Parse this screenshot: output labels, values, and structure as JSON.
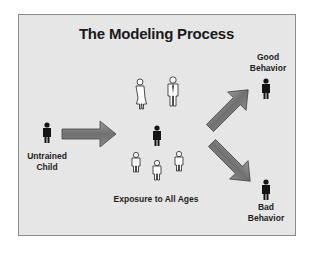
{
  "diagram": {
    "title": "The Modeling Process",
    "nodes": {
      "untrained_child": {
        "line1": "Untrained",
        "line2": "Child",
        "icon": "person-dark-icon"
      },
      "exposure": {
        "label": "Exposure to All Ages",
        "icons": [
          "person-woman-outline-icon",
          "person-man-tie-outline-icon",
          "person-dark-icon",
          "person-child-outline-icon",
          "person-child-outline-icon",
          "person-child-outline-icon"
        ]
      },
      "good_behavior": {
        "line1": "Good",
        "line2": "Behavior",
        "icon": "person-dark-icon"
      },
      "bad_behavior": {
        "line1": "Bad",
        "line2": "Behavior",
        "icon": "person-dark-icon"
      }
    },
    "edges": [
      {
        "from": "untrained_child",
        "to": "exposure"
      },
      {
        "from": "exposure",
        "to": "good_behavior"
      },
      {
        "from": "exposure",
        "to": "bad_behavior"
      }
    ],
    "colors": {
      "background": "#e6e6e6",
      "arrow": "#7a7a7a",
      "figure": "#151515"
    }
  }
}
